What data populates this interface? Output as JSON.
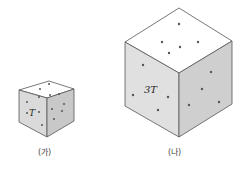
{
  "figure": {
    "cubes": [
      {
        "id": "ga",
        "caption": "(가)",
        "label": "T",
        "colors": {
          "top": "#ffffff",
          "left": "#dadada",
          "right": "#c8c8c8"
        }
      },
      {
        "id": "na",
        "caption": "(나)",
        "label": "3T",
        "colors": {
          "top": "#ffffff",
          "left": "#e0e0e0",
          "right": "#cfcfcf"
        }
      }
    ]
  }
}
